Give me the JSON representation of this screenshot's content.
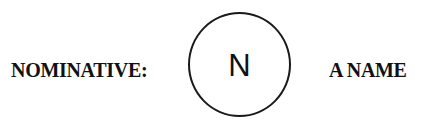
{
  "diagram": {
    "case_label": "NOMINATIVE:",
    "node": {
      "letter": "N",
      "shape": "circle"
    },
    "meaning_label": "A NAME"
  },
  "colors": {
    "background": "#ffffff",
    "text": "#111111",
    "stroke": "#1a1a1a"
  }
}
